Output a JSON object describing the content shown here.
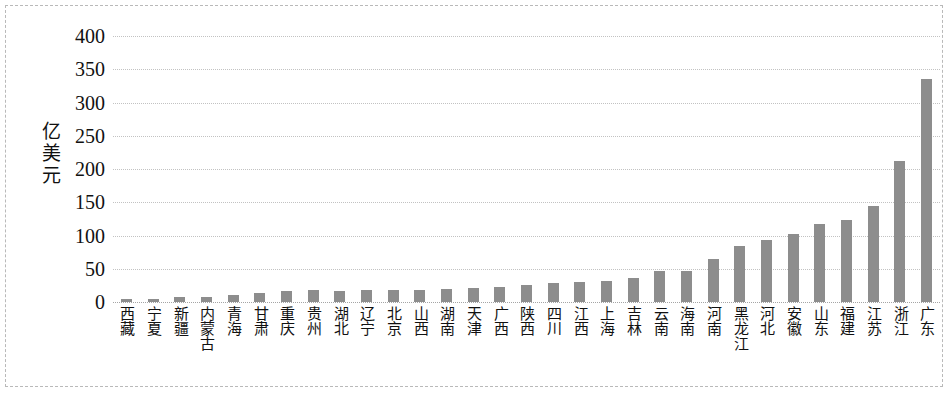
{
  "chart_data": {
    "type": "bar",
    "title": "",
    "subtitle": "",
    "xlabel": "",
    "ylabel": "亿美元",
    "ylim": [
      0,
      400
    ],
    "ytick_step": 50,
    "ytick_labels": [
      "400",
      "350",
      "300",
      "250",
      "200",
      "150",
      "100",
      "50",
      "0"
    ],
    "ytick_values": [
      400,
      350,
      300,
      250,
      200,
      150,
      100,
      50,
      0
    ],
    "grid": true,
    "legend": false,
    "bar_color": "#8d8d8d",
    "categories": [
      "西藏",
      "宁夏",
      "新疆",
      "内蒙古",
      "青海",
      "甘肃",
      "重庆",
      "贵州",
      "湖北",
      "辽宁",
      "北京",
      "山西",
      "湖南",
      "天津",
      "广西",
      "陕西",
      "四川",
      "江西",
      "上海",
      "吉林",
      "云南",
      "海南",
      "河南",
      "黑龙江",
      "河北",
      "安徽",
      "山东",
      "福建",
      "江苏",
      "浙江",
      "广东"
    ],
    "values": [
      4,
      4,
      7,
      8,
      11,
      13,
      17,
      18,
      17,
      18,
      18,
      18,
      20,
      21,
      22,
      25,
      28,
      30,
      31,
      36,
      47,
      46,
      64,
      84,
      94,
      103,
      118,
      124,
      144,
      212,
      335
    ]
  }
}
